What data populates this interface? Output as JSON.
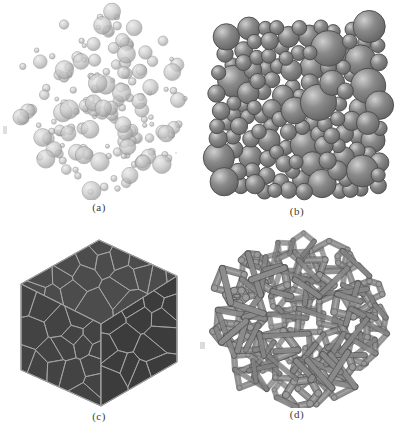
{
  "figure": {
    "background_color": "#ffffff",
    "width": 396,
    "height": 439,
    "layout": "2x2 panel grid"
  },
  "panels": [
    {
      "id": "a",
      "caption": "(a)",
      "name": "dispersed-spheres",
      "description": "Sparse randomly dispersed spheres of varying radii",
      "render": "spheres-scatter",
      "sphere_fill": "#c9c9c9",
      "sphere_edge": "#8d8d8d",
      "highlight": "#e8e8e8",
      "opacity": 0.72,
      "count": 168,
      "radius_min": 2.0,
      "radius_max": 9.5,
      "cluster_radius": 88,
      "center_x": 99,
      "center_y": 100,
      "seed": 20873
    },
    {
      "id": "b",
      "caption": "(b)",
      "name": "dense-sphere-packing",
      "description": "Dense random close packing of spheres in a cubic volume",
      "render": "spheres-packed",
      "sphere_fill": "#8a8a8a",
      "sphere_edge": "#4a4a4a",
      "highlight": "#cfcfcf",
      "shadow": "#5d5d5d",
      "opacity": 1,
      "count": 140,
      "radius_min": 7.0,
      "radius_max": 18.0,
      "box_left": 18,
      "box_top": 24,
      "box_right": 182,
      "box_bottom": 190,
      "seed": 55121
    },
    {
      "id": "c",
      "caption": "(c)",
      "name": "voronoi-polycrystal-cube",
      "description": "Cube with Voronoi tessellated grain structure on three visible faces",
      "render": "voronoi-cube",
      "face_top_fill": "#4c4c4c",
      "face_left_fill": "#434343",
      "face_right_fill": "#3c3c3c",
      "grain_line": "#a6a6a6",
      "grain_line_width": 1.0,
      "outline": "#9a9a9a",
      "cells_per_face": 46,
      "center_x": 99,
      "center_y": 100,
      "cube_half_width": 78,
      "cube_top_y": 18,
      "seed": 7741
    },
    {
      "id": "d",
      "caption": "(d)",
      "name": "open-cell-foam-struts",
      "description": "Open-cell foam: interconnected cylindrical struts forming polygonal cells",
      "render": "strut-network",
      "strut_fill": "#8f8f8f",
      "strut_edge": "#4f4f4f",
      "strut_highlight": "#bdbdbd",
      "node_fill": "#9a9a9a",
      "strut_width": 5.2,
      "cell_count": 58,
      "center_x": 99,
      "center_y": 96,
      "cluster_radius": 86,
      "seed": 30491
    }
  ],
  "artifacts": [
    {
      "name": "scan-mark-left-a",
      "x": 3,
      "y": 126,
      "w": 4,
      "h": 8,
      "color": "#c2c2c2"
    },
    {
      "name": "scan-mark-left-d",
      "x": 200,
      "y": 342,
      "w": 5,
      "h": 7,
      "color": "#bdbdbd"
    },
    {
      "name": "scan-speck-a",
      "x": 175,
      "y": 152,
      "w": 2,
      "h": 2,
      "color": "#d3d3d3"
    }
  ]
}
